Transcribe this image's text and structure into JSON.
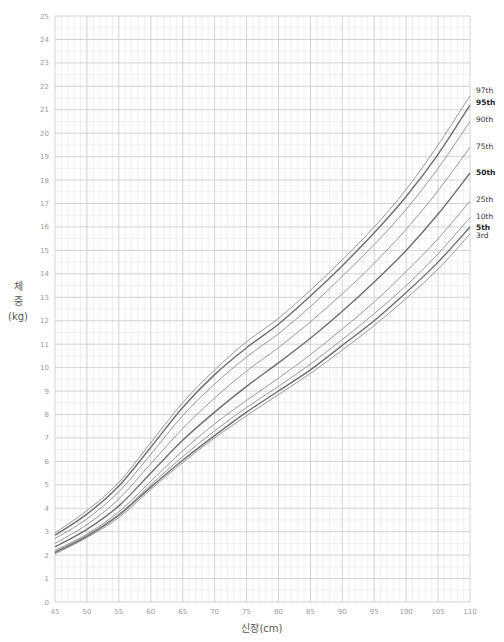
{
  "chart_data": {
    "type": "line",
    "title": "",
    "xlabel": "신장(cm)",
    "ylabel": [
      "체",
      "중",
      "(kg)"
    ],
    "xlim": [
      45,
      110
    ],
    "ylim": [
      0,
      25
    ],
    "x_ticks": [
      45,
      50,
      55,
      60,
      65,
      70,
      75,
      80,
      85,
      90,
      95,
      100,
      105,
      110
    ],
    "y_ticks": [
      0,
      1,
      2,
      3,
      4,
      5,
      6,
      7,
      8,
      9,
      10,
      11,
      12,
      13,
      14,
      15,
      16,
      17,
      18,
      19,
      20,
      21,
      22,
      23,
      24,
      25
    ],
    "grid": true,
    "legend_position": "right-inline",
    "x": [
      45,
      50,
      55,
      60,
      65,
      70,
      75,
      80,
      85,
      90,
      95,
      100,
      105,
      110
    ],
    "series": [
      {
        "name": "97th",
        "bold": false,
        "values": [
          2.95,
          3.9,
          5.1,
          6.8,
          8.5,
          9.9,
          11.1,
          12.1,
          13.3,
          14.6,
          16.0,
          17.6,
          19.5,
          21.6
        ]
      },
      {
        "name": "95th",
        "bold": true,
        "values": [
          2.85,
          3.75,
          4.95,
          6.6,
          8.3,
          9.7,
          10.85,
          11.85,
          13.05,
          14.35,
          15.75,
          17.3,
          19.1,
          21.2
        ]
      },
      {
        "name": "90th",
        "bold": false,
        "values": [
          2.7,
          3.55,
          4.7,
          6.3,
          7.95,
          9.3,
          10.45,
          11.45,
          12.6,
          13.9,
          15.25,
          16.75,
          18.5,
          20.5
        ]
      },
      {
        "name": "75th",
        "bold": false,
        "values": [
          2.5,
          3.3,
          4.4,
          5.9,
          7.4,
          8.7,
          9.85,
          10.85,
          11.95,
          13.15,
          14.45,
          15.9,
          17.55,
          19.4
        ]
      },
      {
        "name": "50th",
        "bold": true,
        "values": [
          2.35,
          3.1,
          4.1,
          5.5,
          6.9,
          8.1,
          9.2,
          10.2,
          11.25,
          12.4,
          13.65,
          15.0,
          16.55,
          18.3
        ]
      },
      {
        "name": "25th",
        "bold": false,
        "values": [
          2.2,
          2.9,
          3.85,
          5.15,
          6.45,
          7.6,
          8.6,
          9.55,
          10.55,
          11.65,
          12.8,
          14.1,
          15.5,
          17.1
        ]
      },
      {
        "name": "10th",
        "bold": false,
        "values": [
          2.15,
          2.85,
          3.75,
          5.0,
          6.2,
          7.3,
          8.3,
          9.2,
          10.15,
          11.2,
          12.3,
          13.5,
          14.85,
          16.4
        ]
      },
      {
        "name": "5th",
        "bold": true,
        "values": [
          2.1,
          2.8,
          3.7,
          4.9,
          6.05,
          7.1,
          8.1,
          9.0,
          9.9,
          10.95,
          12.0,
          13.2,
          14.5,
          16.0
        ]
      },
      {
        "name": "3rd",
        "bold": false,
        "values": [
          2.05,
          2.75,
          3.6,
          4.8,
          5.95,
          7.0,
          7.95,
          8.85,
          9.75,
          10.75,
          11.8,
          12.95,
          14.2,
          15.7
        ]
      }
    ],
    "label_y_positions": {
      "97th": 21.85,
      "95th": 21.35,
      "90th": 20.6,
      "75th": 19.45,
      "50th": 18.35,
      "25th": 17.2,
      "10th": 16.45,
      "5th": 16.0,
      "3rd": 15.65
    }
  },
  "colors": {
    "curve": "#8c8c8c",
    "curve_bold": "#6e6e6e",
    "grid_major": "#c8c8c8",
    "grid_minor": "#e6e6e6",
    "axis_text": "#9a9a9a"
  }
}
